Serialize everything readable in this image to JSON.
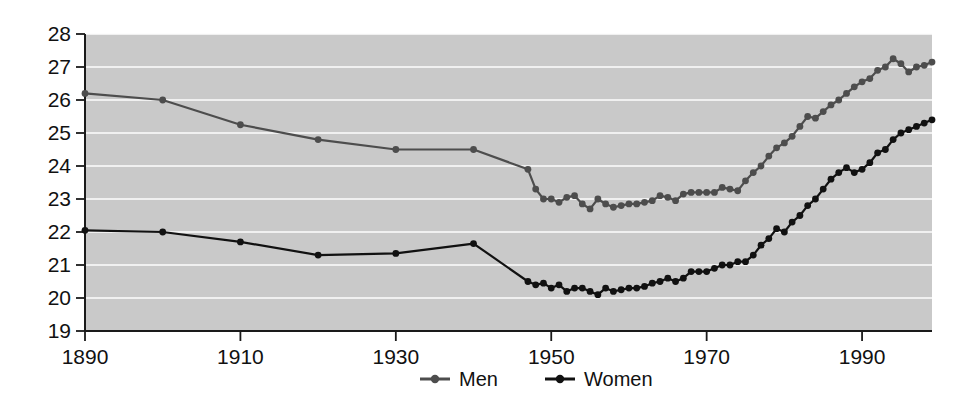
{
  "chart_data": {
    "type": "line",
    "title": "",
    "subtitle": "",
    "xlabel": "",
    "ylabel": "",
    "xlim": [
      1890,
      1999
    ],
    "ylim": [
      19,
      28
    ],
    "grid": true,
    "legend_position": "bottom",
    "y_ticks": [
      19,
      20,
      21,
      22,
      23,
      24,
      25,
      26,
      27,
      28
    ],
    "x_ticks": [
      1890,
      1910,
      1930,
      1950,
      1970,
      1990
    ],
    "series": [
      {
        "name": "Men",
        "color": "#4d4d4d",
        "marker": "circle",
        "x": [
          1890,
          1900,
          1910,
          1920,
          1930,
          1940,
          1947,
          1948,
          1949,
          1950,
          1951,
          1952,
          1953,
          1954,
          1955,
          1956,
          1957,
          1958,
          1959,
          1960,
          1961,
          1962,
          1963,
          1964,
          1965,
          1966,
          1967,
          1968,
          1969,
          1970,
          1971,
          1972,
          1973,
          1974,
          1975,
          1976,
          1977,
          1978,
          1979,
          1980,
          1981,
          1982,
          1983,
          1984,
          1985,
          1986,
          1987,
          1988,
          1989,
          1990,
          1991,
          1992,
          1993,
          1994,
          1995,
          1996,
          1997,
          1998,
          1999
        ],
        "values": [
          26.2,
          26.0,
          25.25,
          24.8,
          24.5,
          24.5,
          23.9,
          23.3,
          23.0,
          23.0,
          22.9,
          23.05,
          23.1,
          22.85,
          22.7,
          23.0,
          22.85,
          22.75,
          22.8,
          22.85,
          22.85,
          22.9,
          22.95,
          23.1,
          23.05,
          22.95,
          23.15,
          23.2,
          23.2,
          23.2,
          23.2,
          23.35,
          23.3,
          23.25,
          23.55,
          23.8,
          24.0,
          24.3,
          24.55,
          24.7,
          24.9,
          25.2,
          25.5,
          25.45,
          25.65,
          25.85,
          26.0,
          26.2,
          26.4,
          26.55,
          26.65,
          26.9,
          27.0,
          27.25,
          27.1,
          26.85,
          27.0,
          27.05,
          27.15
        ]
      },
      {
        "name": "Women",
        "color": "#111111",
        "marker": "circle",
        "x": [
          1890,
          1900,
          1910,
          1920,
          1930,
          1940,
          1947,
          1948,
          1949,
          1950,
          1951,
          1952,
          1953,
          1954,
          1955,
          1956,
          1957,
          1958,
          1959,
          1960,
          1961,
          1962,
          1963,
          1964,
          1965,
          1966,
          1967,
          1968,
          1969,
          1970,
          1971,
          1972,
          1973,
          1974,
          1975,
          1976,
          1977,
          1978,
          1979,
          1980,
          1981,
          1982,
          1983,
          1984,
          1985,
          1986,
          1987,
          1988,
          1989,
          1990,
          1991,
          1992,
          1993,
          1994,
          1995,
          1996,
          1997,
          1998,
          1999
        ],
        "values": [
          22.05,
          22.0,
          21.7,
          21.3,
          21.35,
          21.65,
          20.5,
          20.4,
          20.45,
          20.3,
          20.4,
          20.2,
          20.3,
          20.3,
          20.2,
          20.1,
          20.3,
          20.2,
          20.25,
          20.3,
          20.3,
          20.35,
          20.45,
          20.5,
          20.6,
          20.5,
          20.6,
          20.8,
          20.8,
          20.8,
          20.9,
          21.0,
          21.0,
          21.1,
          21.1,
          21.3,
          21.6,
          21.8,
          22.1,
          22.0,
          22.3,
          22.5,
          22.8,
          23.0,
          23.3,
          23.6,
          23.8,
          23.95,
          23.8,
          23.9,
          24.1,
          24.4,
          24.5,
          24.8,
          25.0,
          25.1,
          25.2,
          25.3,
          25.4
        ]
      }
    ],
    "legend": [
      {
        "label": "Men",
        "color": "#4d4d4d"
      },
      {
        "label": "Women",
        "color": "#111111"
      }
    ]
  }
}
